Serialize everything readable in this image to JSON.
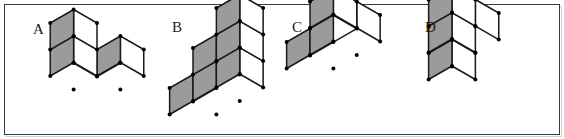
{
  "figure": {
    "caption": "",
    "background_color": "#ffffff",
    "border_color": "#3a3a3a",
    "shadow_color": "#cfcfcf",
    "edge_color": "#1a1a1a",
    "vertex_dot_color": "#000000",
    "face_top_color": "#ffffff",
    "face_shaded_color": "#9b9b9b",
    "panels": [
      {
        "id": "A",
        "label": "A",
        "label_x": 33,
        "label_y": 34,
        "description": "isometric block assembly A",
        "cube_count": 4,
        "cubes": [
          {
            "x": 0,
            "y": 0,
            "z": 0
          },
          {
            "x": 1,
            "y": 0,
            "z": 0
          },
          {
            "x": 0,
            "y": 1,
            "z": 0
          },
          {
            "x": 0,
            "y": 1,
            "z": 1
          }
        ],
        "origin_x": 97,
        "origin_y": 103
      },
      {
        "id": "B",
        "label": "B",
        "label_x": 172,
        "label_y": 32,
        "description": "isometric staircase assembly B",
        "cube_count": 6,
        "cubes": [
          {
            "x": 0,
            "y": 0,
            "z": 0
          },
          {
            "x": 1,
            "y": 0,
            "z": 0
          },
          {
            "x": 1,
            "y": 0,
            "z": 1
          },
          {
            "x": 2,
            "y": 0,
            "z": 0
          },
          {
            "x": 2,
            "y": 0,
            "z": 1
          },
          {
            "x": 2,
            "y": 0,
            "z": 2
          }
        ],
        "origin_x": 193,
        "origin_y": 128
      },
      {
        "id": "C",
        "label": "C",
        "label_x": 292,
        "label_y": 32,
        "description": "isometric block assembly C",
        "cube_count": 5,
        "cubes": [
          {
            "x": 0,
            "y": 0,
            "z": 0
          },
          {
            "x": 1,
            "y": 0,
            "z": 0
          },
          {
            "x": 2,
            "y": 0,
            "z": 0
          },
          {
            "x": 2,
            "y": 1,
            "z": 0
          },
          {
            "x": 2,
            "y": 1,
            "z": 1
          }
        ],
        "origin_x": 310,
        "origin_y": 82
      },
      {
        "id": "D",
        "label": "D",
        "label_x": 425,
        "label_y": 32,
        "description": "isometric block assembly D",
        "cube_count": 5,
        "cubes": [
          {
            "x": 0,
            "y": 0,
            "z": 0
          },
          {
            "x": 0,
            "y": 0,
            "z": 1
          },
          {
            "x": 1,
            "y": 0,
            "z": 1
          },
          {
            "x": 1,
            "y": 1,
            "z": 0
          },
          {
            "x": 1,
            "y": 1,
            "z": 1
          }
        ],
        "origin_x": 452,
        "origin_y": 93
      }
    ]
  }
}
